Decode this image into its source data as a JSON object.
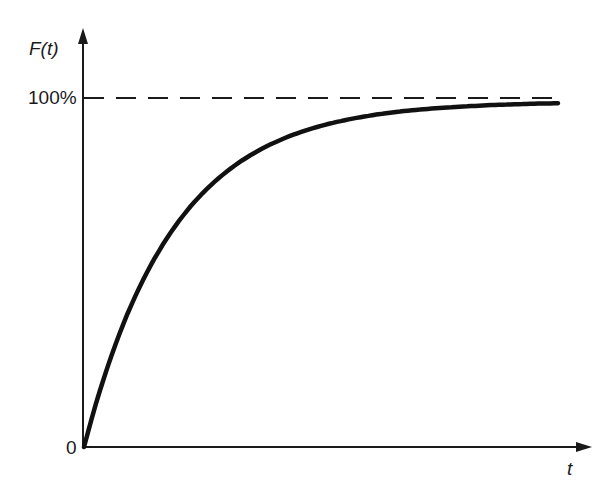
{
  "chart_data": {
    "type": "line",
    "title": "",
    "xlabel": "t",
    "ylabel": "F(t)",
    "y_tick_labels": [
      "0",
      "100%"
    ],
    "x_tick_labels": [],
    "ylim": [
      0,
      100
    ],
    "xlim": [
      0,
      5.6
    ],
    "grid": false,
    "legend": null,
    "annotations": [
      {
        "type": "dashed-asymptote",
        "y": 100,
        "label": "100%"
      }
    ],
    "series": [
      {
        "name": "F(t)",
        "description": "Saturating exponential growth approaching 100%",
        "x": [
          0,
          0.5,
          1.0,
          1.5,
          2.0,
          2.5,
          3.0,
          3.5,
          4.0,
          4.5,
          5.0,
          5.3
        ],
        "values": [
          0,
          39,
          63,
          78,
          86,
          92,
          95,
          97,
          98,
          98.5,
          99,
          99
        ]
      }
    ]
  },
  "labels": {
    "y_axis": "F(t)",
    "y_top": "100%",
    "origin": "0",
    "x_axis": "t"
  },
  "colors": {
    "curve": "#111111",
    "axis": "#1a1a1a",
    "asymptote": "#1a1a1a"
  }
}
